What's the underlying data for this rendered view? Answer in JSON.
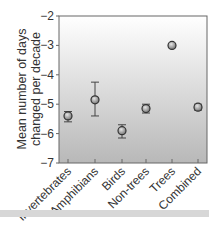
{
  "chart_data": {
    "type": "scatter",
    "title": "",
    "xlabel": "",
    "ylabel": "Mean number of days changed per decade",
    "ylabel_lines": [
      "Mean number of days",
      "changed per decade"
    ],
    "categories": [
      "Invertebrates",
      "Amphibians",
      "Birds",
      "Non-trees",
      "Trees",
      "Combined"
    ],
    "values": [
      -5.4,
      -4.85,
      -5.9,
      -5.15,
      -3.0,
      -5.1
    ],
    "error_low": [
      -5.6,
      -5.4,
      -6.15,
      -5.3,
      -3.05,
      -5.2
    ],
    "error_high": [
      -5.25,
      -4.25,
      -5.7,
      -5.0,
      -2.95,
      -5.0
    ],
    "ylim": [
      -7,
      -2
    ],
    "yticks": [
      -2,
      -3,
      -4,
      -5,
      -6,
      -7
    ],
    "ytick_labels": [
      "−2",
      "−3",
      "−4",
      "−5",
      "−6",
      "−7"
    ],
    "grid": false,
    "legend": null,
    "background": "vertical gradient white (top) to gray (bottom)"
  },
  "colors": {
    "marker_fill": "#9a9a9a",
    "marker_edge": "#333333",
    "axis": "#555555",
    "gradient_top": "#ffffff",
    "gradient_bottom": "#b8b8b8",
    "bottom_band": "#d7d7d7"
  }
}
